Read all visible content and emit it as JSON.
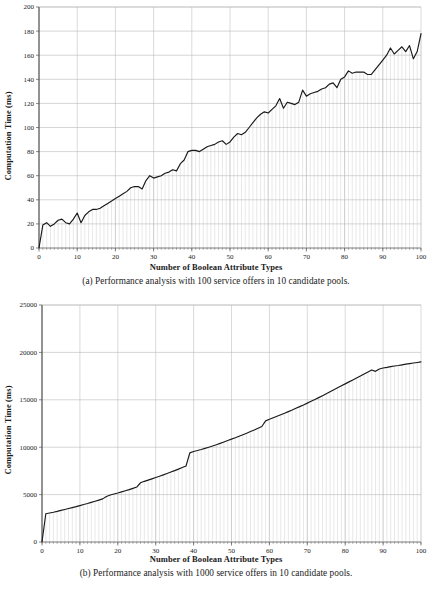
{
  "page": {
    "background": "#ffffff",
    "ink": "#1a1a1a",
    "gridline_color": "#b4b4b4",
    "dropline_color": "#cccccc",
    "series_color": "#1a1a1a"
  },
  "figures": [
    {
      "id": "a",
      "caption": "(a) Performance analysis with 100 service offers in 10 candidate pools.",
      "xlabel": "Number of Boolean Attribute Types",
      "ylabel": "Computation Time (ms)"
    },
    {
      "id": "b",
      "caption": "(b) Performance analysis with 1000 service offers in 10 candidate pools.",
      "xlabel": "Number of Boolean Attribute Types",
      "ylabel": "Computation Time (ms)"
    }
  ],
  "chart_data": [
    {
      "type": "line",
      "id": "chart-a",
      "title": "",
      "xlabel": "Number of Boolean Attribute Types",
      "ylabel": "Computation Time (ms)",
      "xlim": [
        0,
        100
      ],
      "ylim": [
        0,
        200
      ],
      "xticks": [
        0,
        10,
        20,
        30,
        40,
        50,
        60,
        70,
        80,
        90,
        100
      ],
      "yticks": [
        0,
        20,
        40,
        60,
        80,
        100,
        120,
        140,
        160,
        180,
        200
      ],
      "grid": "horizontal-major plus vertical droplines at each x",
      "legend": "none",
      "droplines": true,
      "x": [
        0,
        1,
        2,
        3,
        4,
        5,
        6,
        7,
        8,
        9,
        10,
        11,
        12,
        13,
        14,
        15,
        16,
        17,
        18,
        19,
        20,
        21,
        22,
        23,
        24,
        25,
        26,
        27,
        28,
        29,
        30,
        31,
        32,
        33,
        34,
        35,
        36,
        37,
        38,
        39,
        40,
        41,
        42,
        43,
        44,
        45,
        46,
        47,
        48,
        49,
        50,
        51,
        52,
        53,
        54,
        55,
        56,
        57,
        58,
        59,
        60,
        61,
        62,
        63,
        64,
        65,
        66,
        67,
        68,
        69,
        70,
        71,
        72,
        73,
        74,
        75,
        76,
        77,
        78,
        79,
        80,
        81,
        82,
        83,
        84,
        85,
        86,
        87,
        88,
        89,
        90,
        91,
        92,
        93,
        94,
        95,
        96,
        97,
        98,
        99,
        100
      ],
      "values": [
        0,
        19,
        21,
        18,
        20,
        23,
        24,
        21,
        20,
        24,
        29,
        21,
        27,
        30,
        32,
        32,
        33,
        35,
        37,
        39,
        41,
        43,
        45,
        47,
        50,
        51,
        51,
        49,
        56,
        60,
        58,
        59,
        60,
        62,
        63,
        65,
        64,
        70,
        73,
        80,
        81,
        81,
        80,
        82,
        84,
        85,
        86,
        88,
        89,
        86,
        88,
        92,
        95,
        94,
        96,
        100,
        104,
        108,
        111,
        113,
        112,
        115,
        118,
        124,
        116,
        121,
        120,
        119,
        121,
        131,
        126,
        128,
        129,
        130,
        132,
        133,
        136,
        137,
        133,
        140,
        142,
        147,
        145,
        146,
        146,
        146,
        144,
        144,
        148,
        152,
        156,
        160,
        166,
        161,
        164,
        167,
        163,
        168,
        157,
        163,
        178
      ]
    },
    {
      "type": "line",
      "id": "chart-b",
      "title": "",
      "xlabel": "Number of Boolean Attribute Types",
      "ylabel": "Computation Time (ms)",
      "xlim": [
        0,
        100
      ],
      "ylim": [
        0,
        25000
      ],
      "xticks": [
        0,
        10,
        20,
        30,
        40,
        50,
        60,
        70,
        80,
        90,
        100
      ],
      "yticks": [
        0,
        5000,
        10000,
        15000,
        20000,
        25000
      ],
      "grid": "horizontal-major plus vertical droplines at each x",
      "legend": "none",
      "droplines": true,
      "x": [
        0,
        1,
        2,
        3,
        4,
        5,
        6,
        7,
        8,
        9,
        10,
        11,
        12,
        13,
        14,
        15,
        16,
        17,
        18,
        19,
        20,
        21,
        22,
        23,
        24,
        25,
        26,
        27,
        28,
        29,
        30,
        31,
        32,
        33,
        34,
        35,
        36,
        37,
        38,
        39,
        40,
        41,
        42,
        43,
        44,
        45,
        46,
        47,
        48,
        49,
        50,
        51,
        52,
        53,
        54,
        55,
        56,
        57,
        58,
        59,
        60,
        61,
        62,
        63,
        64,
        65,
        66,
        67,
        68,
        69,
        70,
        71,
        72,
        73,
        74,
        75,
        76,
        77,
        78,
        79,
        80,
        81,
        82,
        83,
        84,
        85,
        86,
        87,
        88,
        89,
        90,
        91,
        92,
        93,
        94,
        95,
        96,
        97,
        98,
        99,
        100
      ],
      "values": [
        0,
        2980,
        3060,
        3140,
        3230,
        3330,
        3430,
        3530,
        3630,
        3730,
        3840,
        3950,
        4060,
        4180,
        4300,
        4420,
        4550,
        4800,
        4950,
        5060,
        5170,
        5290,
        5410,
        5530,
        5660,
        5800,
        6250,
        6400,
        6530,
        6660,
        6800,
        6940,
        7080,
        7230,
        7380,
        7530,
        7690,
        7850,
        8020,
        9400,
        9550,
        9650,
        9760,
        9880,
        10000,
        10130,
        10260,
        10400,
        10550,
        10700,
        10850,
        11000,
        11160,
        11320,
        11480,
        11650,
        11820,
        12000,
        12180,
        12780,
        12940,
        13100,
        13260,
        13420,
        13580,
        13750,
        13920,
        14100,
        14280,
        14460,
        14650,
        14840,
        15030,
        15230,
        15430,
        15630,
        15840,
        16050,
        16260,
        16470,
        16680,
        16890,
        17100,
        17310,
        17520,
        17730,
        17940,
        18150,
        18000,
        18250,
        18350,
        18420,
        18500,
        18560,
        18620,
        18690,
        18760,
        18820,
        18880,
        18940,
        19000
      ]
    }
  ]
}
